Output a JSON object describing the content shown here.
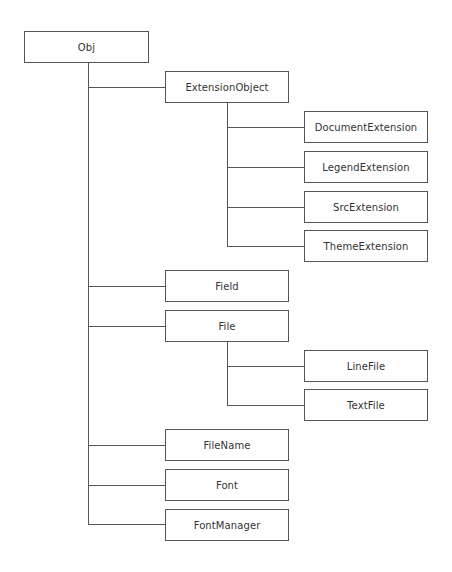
{
  "diagram": {
    "type": "class-hierarchy-tree",
    "root": "Obj",
    "nodes": {
      "obj": "Obj",
      "extension_object": "ExtensionObject",
      "document_extension": "DocumentExtension",
      "legend_extension": "LegendExtension",
      "src_extension": "SrcExtension",
      "theme_extension": "ThemeExtension",
      "field": "Field",
      "file": "File",
      "line_file": "LineFile",
      "text_file": "TextFile",
      "file_name": "FileName",
      "font": "Font",
      "font_manager": "FontManager"
    },
    "edges": [
      [
        "Obj",
        "ExtensionObject"
      ],
      [
        "ExtensionObject",
        "DocumentExtension"
      ],
      [
        "ExtensionObject",
        "LegendExtension"
      ],
      [
        "ExtensionObject",
        "SrcExtension"
      ],
      [
        "ExtensionObject",
        "ThemeExtension"
      ],
      [
        "Obj",
        "Field"
      ],
      [
        "Obj",
        "File"
      ],
      [
        "File",
        "LineFile"
      ],
      [
        "File",
        "TextFile"
      ],
      [
        "Obj",
        "FileName"
      ],
      [
        "Obj",
        "Font"
      ],
      [
        "Obj",
        "FontManager"
      ]
    ],
    "colors": {
      "line": "#555555",
      "text": "#333333",
      "background": "#ffffff"
    }
  }
}
